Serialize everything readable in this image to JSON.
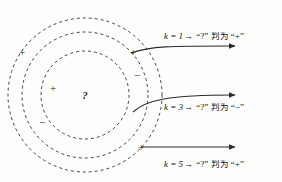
{
  "figure": {
    "type": "knn-classification-diagram",
    "background_color": "#fefefe",
    "stroke_color": "#2b2b2b"
  },
  "circles": {
    "center": {
      "x": 85,
      "y": 95
    },
    "query_label": "?",
    "rings": [
      {
        "name": "inner-ring",
        "radius": 44,
        "dash": "3 3"
      },
      {
        "name": "middle-ring",
        "radius": 63,
        "dash": "3 3"
      },
      {
        "name": "outer-ring",
        "radius": 77,
        "dash": "3 3"
      }
    ]
  },
  "markers": [
    {
      "name": "plus-outer-upper-left",
      "sign": "+",
      "x": 22,
      "y": 52
    },
    {
      "name": "plus-inner-left",
      "sign": "+",
      "x": 53,
      "y": 88
    },
    {
      "name": "minus-middle-lower-left",
      "sign": "−",
      "x": 42,
      "y": 122
    },
    {
      "name": "minus-inner-right",
      "sign": "−",
      "x": 137,
      "y": 75
    },
    {
      "name": "plus-middle-upper-right",
      "sign": "+",
      "x": 133,
      "y": 52
    },
    {
      "name": "plus-outer-lower-right",
      "sign": "+",
      "x": 141,
      "y": 147
    }
  ],
  "arrows": [
    {
      "name": "arrow-k1",
      "k_text": "k = 1",
      "to_symbol": "→",
      "query": "“?”",
      "verdict_cjk": "判为",
      "verdict": "“+”",
      "label_x": 164,
      "label_y": 32,
      "tail_x": 133,
      "tail_y": 52,
      "head_x": 235,
      "head_y": 46
    },
    {
      "name": "arrow-k3",
      "k_text": "k = 3",
      "to_symbol": "→",
      "query": "“?”",
      "verdict_cjk": "判为",
      "verdict": "“−”",
      "label_x": 164,
      "label_y": 103,
      "tail_x": 137,
      "tail_y": 110,
      "head_x": 235,
      "head_y": 95
    },
    {
      "name": "arrow-k5",
      "k_text": "k = 5",
      "to_symbol": "→",
      "query": "“?”",
      "verdict_cjk": "判为",
      "verdict": "“+”",
      "label_x": 164,
      "label_y": 160,
      "tail_x": 141,
      "tail_y": 147,
      "head_x": 235,
      "head_y": 147
    }
  ]
}
